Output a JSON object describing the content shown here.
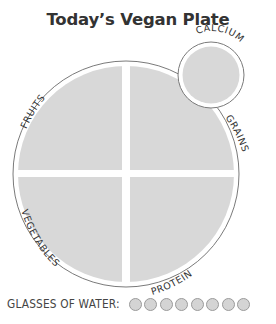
{
  "title": "Today’s Vegan Plate",
  "plate": {
    "sections": [
      {
        "id": "fruits",
        "label": "FRUITS"
      },
      {
        "id": "grains",
        "label": "GRAINS"
      },
      {
        "id": "vegetables",
        "label": "VEGETABLES"
      },
      {
        "id": "protein",
        "label": "PROTEIN"
      }
    ],
    "side": {
      "id": "calcium",
      "label": "CALCIUM"
    }
  },
  "water": {
    "label": "GLASSES OF WATER:",
    "glass_count": 8
  },
  "colors": {
    "fill": "#d8d8d8",
    "outline": "#7a7a7a",
    "text": "#333333",
    "background": "#ffffff"
  }
}
